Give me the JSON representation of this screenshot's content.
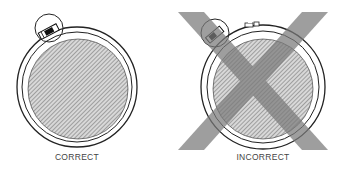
{
  "figures": [
    {
      "id": "correct",
      "label": "CORRECT",
      "center": [
        77,
        87
      ],
      "outer_radius": 60,
      "inner_radius": 52,
      "incorrect_mark": false
    },
    {
      "id": "incorrect",
      "label": "INCORRECT",
      "center": [
        263,
        87
      ],
      "outer_radius": 62,
      "inner_radius": 52,
      "incorrect_mark": true
    }
  ],
  "colors": {
    "line": "#222222",
    "hatch_fill": "#b5b5b5",
    "x_mark": "#8a8a8a",
    "background": "#ffffff"
  }
}
